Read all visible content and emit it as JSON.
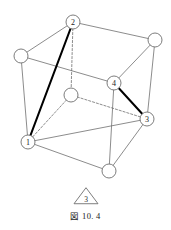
{
  "figure": {
    "caption": "図 10. 4",
    "background_color": "#ffffff",
    "line_color": "#6e6e6e",
    "bold_line_color": "#000000",
    "node_fill": "#ffffff",
    "node_stroke": "#6e6e6e",
    "label_color": "#1a1a1a"
  },
  "graph": {
    "type": "cube-graph",
    "node_radius": 7,
    "nodes": [
      {
        "id": "n2",
        "label": "2",
        "x": 73,
        "y": 22,
        "labeled": true,
        "name": "node-2"
      },
      {
        "id": "nTL",
        "label": "",
        "x": 21,
        "y": 56,
        "labeled": false,
        "name": "node-top-left-unlabeled"
      },
      {
        "id": "nTR",
        "label": "",
        "x": 155,
        "y": 40,
        "labeled": false,
        "name": "node-top-right-unlabeled"
      },
      {
        "id": "n4",
        "label": "4",
        "x": 114,
        "y": 83,
        "labeled": true,
        "name": "node-4"
      },
      {
        "id": "nC",
        "label": "",
        "x": 71,
        "y": 95,
        "labeled": false,
        "name": "node-interior-unlabeled"
      },
      {
        "id": "n3",
        "label": "3",
        "x": 147,
        "y": 119,
        "labeled": true,
        "name": "node-3"
      },
      {
        "id": "n1",
        "label": "1",
        "x": 28,
        "y": 142,
        "labeled": true,
        "name": "node-1"
      },
      {
        "id": "nB",
        "label": "",
        "x": 109,
        "y": 171,
        "labeled": false,
        "name": "node-bottom-unlabeled"
      }
    ],
    "edges": [
      {
        "from": "nTL",
        "to": "n2",
        "style": "solid",
        "weight": "thin",
        "name": "edge-topleft-2"
      },
      {
        "from": "n2",
        "to": "nTR",
        "style": "solid",
        "weight": "thin",
        "name": "edge-2-topright"
      },
      {
        "from": "nTL",
        "to": "n4",
        "style": "solid",
        "weight": "thin",
        "name": "edge-topleft-4"
      },
      {
        "from": "n4",
        "to": "nTR",
        "style": "solid",
        "weight": "thin",
        "name": "edge-4-topright"
      },
      {
        "from": "nTL",
        "to": "n1",
        "style": "solid",
        "weight": "thin",
        "name": "edge-topleft-1"
      },
      {
        "from": "nTR",
        "to": "n3",
        "style": "solid",
        "weight": "thin",
        "name": "edge-topright-3"
      },
      {
        "from": "n1",
        "to": "nB",
        "style": "solid",
        "weight": "thin",
        "name": "edge-1-bottom"
      },
      {
        "from": "nB",
        "to": "n3",
        "style": "solid",
        "weight": "thin",
        "name": "edge-bottom-3"
      },
      {
        "from": "n4",
        "to": "nB",
        "style": "solid",
        "weight": "thin",
        "name": "edge-4-bottom"
      },
      {
        "from": "n1",
        "to": "n3",
        "style": "solid",
        "weight": "thin",
        "name": "edge-1-3"
      },
      {
        "from": "n2",
        "to": "nC",
        "style": "dashed",
        "weight": "thin",
        "name": "edge-2-interior"
      },
      {
        "from": "nC",
        "to": "n1",
        "style": "dashed",
        "weight": "thin",
        "name": "edge-interior-1"
      },
      {
        "from": "nC",
        "to": "n3",
        "style": "dashed",
        "weight": "thin",
        "name": "edge-interior-3"
      },
      {
        "from": "n1",
        "to": "n2",
        "style": "solid",
        "weight": "bold",
        "name": "edge-1-2-bold"
      },
      {
        "from": "n4",
        "to": "n3",
        "style": "solid",
        "weight": "bold",
        "name": "edge-4-3-bold"
      }
    ]
  },
  "triangle_marker": {
    "label": "3",
    "cx": 86,
    "cy": 197,
    "half_width": 12,
    "height": 16,
    "name": "triangle-marker-3"
  }
}
